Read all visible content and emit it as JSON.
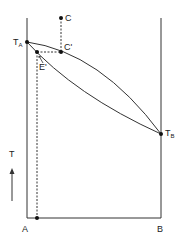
{
  "diagram": {
    "type": "binary-phase-diagram",
    "axis_label_temperature": "T",
    "composition_left": "A",
    "composition_right": "B",
    "points": {
      "TA": {
        "main": "T",
        "sub": "A"
      },
      "TB": {
        "main": "T",
        "sub": "B"
      },
      "C": {
        "label": "C"
      },
      "C_prime": {
        "label": "C'"
      },
      "E_prime": {
        "label": "E'"
      }
    }
  }
}
